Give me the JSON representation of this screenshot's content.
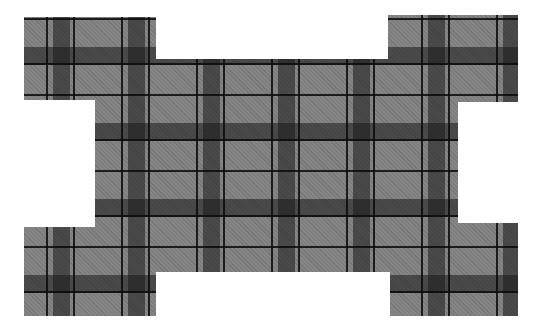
{
  "image": {
    "subject": "plaid fabric cutout",
    "description": "Gray tartan/plaid fabric piece cut in a cross-like shape with four corner tabs",
    "colors": {
      "background": "#ffffff",
      "base_gray": "#858585",
      "dark_stripe": "#4a4a4a",
      "intersection": "#262626",
      "line": "#111111"
    },
    "shape": {
      "top_left_tab": {
        "x": 24,
        "y": 17,
        "w": 132,
        "h": 83
      },
      "top_right_tab": {
        "x": 388,
        "y": 15,
        "w": 130,
        "h": 87
      },
      "center_body": {
        "x": 95,
        "y": 59,
        "w": 363,
        "h": 213
      },
      "bottom_left_tab": {
        "x": 24,
        "y": 227,
        "w": 132,
        "h": 89
      },
      "bottom_right_tab": {
        "x": 390,
        "y": 223,
        "w": 128,
        "h": 93
      }
    },
    "pattern": {
      "repeat_x_px": 75,
      "repeat_y_px": 76
    }
  }
}
